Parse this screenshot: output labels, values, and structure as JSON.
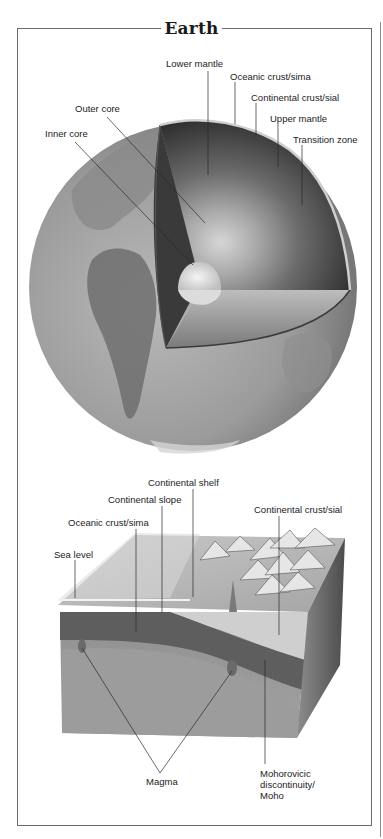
{
  "title": "Earth",
  "globe": {
    "labels": [
      {
        "id": "lower-mantle",
        "text": "Lower mantle",
        "x": 166,
        "y": 58,
        "line": [
          208,
          71,
          208,
          175
        ]
      },
      {
        "id": "oceanic-crust-sima",
        "text": "Oceanic crust/sima",
        "x": 230,
        "y": 71,
        "line": [
          235,
          82,
          235,
          124
        ]
      },
      {
        "id": "continental-crust-sial",
        "text": "Continental crust/sial",
        "x": 251,
        "y": 92,
        "line": [
          256,
          103,
          256,
          135
        ]
      },
      {
        "id": "upper-mantle",
        "text": "Upper mantle",
        "x": 270,
        "y": 113,
        "line": [
          278,
          124,
          278,
          167
        ]
      },
      {
        "id": "transition-zone",
        "text": "Transition zone",
        "x": 293,
        "y": 134,
        "line": [
          302,
          145,
          302,
          205
        ]
      },
      {
        "id": "outer-core",
        "text": "Outer core",
        "x": 75,
        "y": 103,
        "line": [
          107,
          117,
          205,
          223
        ]
      },
      {
        "id": "inner-core",
        "text": "Inner core",
        "x": 45,
        "y": 128,
        "line": [
          75,
          142,
          193,
          265
        ]
      }
    ]
  },
  "block": {
    "labels": [
      {
        "id": "continental-shelf",
        "text": "Continental shelf",
        "x": 148,
        "y": 477,
        "line": [
          193,
          489,
          193,
          597
        ]
      },
      {
        "id": "continental-slope",
        "text": "Continental slope",
        "x": 108,
        "y": 494,
        "line": [
          162,
          506,
          162,
          613
        ]
      },
      {
        "id": "oceanic-crust-sima",
        "text": "Oceanic crust/sima",
        "x": 68,
        "y": 517,
        "line": [
          136,
          529,
          136,
          632
        ]
      },
      {
        "id": "continental-crust-sial",
        "text": "Continental crust/sial",
        "x": 254,
        "y": 504,
        "line": [
          279,
          516,
          279,
          635
        ]
      },
      {
        "id": "sea-level",
        "text": "Sea level",
        "x": 54,
        "y": 549,
        "line": [
          75,
          560,
          75,
          598
        ]
      },
      {
        "id": "magma",
        "text": "Magma",
        "x": 146,
        "y": 776
      },
      {
        "id": "moho",
        "text": "Mohorovicic\ndiscontinuity/\nMoho",
        "x": 260,
        "y": 768,
        "line": [
          265,
          660,
          265,
          764
        ]
      }
    ],
    "magma_lines": [
      [
        160,
        773,
        82,
        648
      ],
      [
        160,
        773,
        232,
        671
      ]
    ]
  }
}
